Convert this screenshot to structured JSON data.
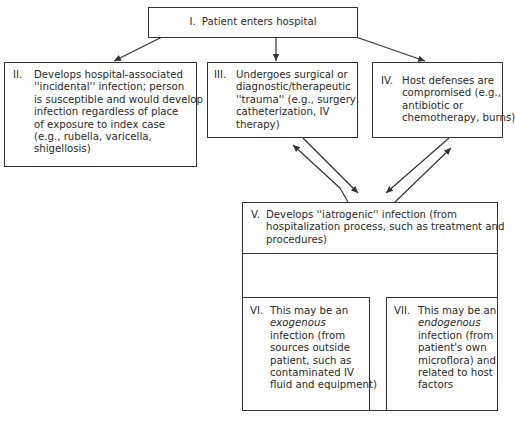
{
  "diagram": {
    "type": "flowchart",
    "title": "",
    "nodes": [
      {
        "id": "I",
        "num": "I.",
        "lines": [
          "Patient enters hospital"
        ]
      },
      {
        "id": "II",
        "num": "II.",
        "lines": [
          "Develops hospital-associated",
          "''incidental'' infection; person",
          "is susceptible and would develop",
          "infection regardless of place",
          "of exposure to index case",
          "(e.g., rubella, varicella,",
          "shigellosis)"
        ]
      },
      {
        "id": "III",
        "num": "III.",
        "lines": [
          "Undergoes surgical or",
          "diagnostic/therapeutic",
          "''trauma'' (e.g., surgery,",
          "catheterization, IV",
          "therapy)"
        ]
      },
      {
        "id": "IV",
        "num": "IV.",
        "lines": [
          "Host defenses are",
          "compromised (e.g.,",
          "antibiotic or",
          "chemotherapy, burns)"
        ]
      },
      {
        "id": "V",
        "num": "V.",
        "lines": [
          "Develops ''iatrogenic'' infection (from",
          "hospitalization process, such as treatment and",
          "procedures)"
        ]
      },
      {
        "id": "VI",
        "num": "VI.",
        "lines": [
          "This may be an",
          "exogenous",
          "infection (from",
          "sources outside",
          "patient, such as",
          "contaminated IV",
          "fluid and equipment)"
        ],
        "italic_words": [
          "exogenous",
          "outside"
        ]
      },
      {
        "id": "VII",
        "num": "VII.",
        "lines": [
          "This may be an",
          "endogenous",
          "infection (from",
          "patient's own",
          "microflora) and",
          "related to host",
          "factors"
        ],
        "italic_words": [
          "endogenous"
        ]
      }
    ],
    "edges": [
      {
        "from": "I",
        "to": "II",
        "type": "arrow"
      },
      {
        "from": "I",
        "to": "III",
        "type": "arrow"
      },
      {
        "from": "I",
        "to": "IV",
        "type": "arrow"
      },
      {
        "from": "III",
        "to": "V",
        "type": "bidirectional-double-arrow"
      },
      {
        "from": "IV",
        "to": "V",
        "type": "bidirectional-double-arrow"
      },
      {
        "from": "V",
        "to": "VI",
        "type": "arrow"
      },
      {
        "from": "V",
        "to": "VII",
        "type": "arrow"
      }
    ],
    "colors": {
      "line": "#333333",
      "text": "#2a2a2a",
      "background": "#ffffff"
    }
  }
}
